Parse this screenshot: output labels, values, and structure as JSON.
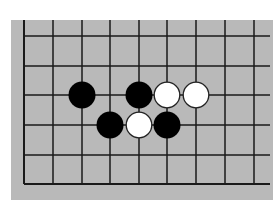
{
  "diagram": {
    "type": "go-board-fragment",
    "board_color": "#b9b9b9",
    "line_color": "#1a1a1a",
    "grid": {
      "x_lines": [
        24,
        53,
        82,
        110,
        139,
        167,
        196,
        225,
        254
      ],
      "y_lines": [
        36,
        66,
        95,
        125,
        155,
        184
      ],
      "left_edge_closed": true,
      "bottom_edge_closed": true,
      "top_edge_closed": false,
      "right_edge_closed": false
    },
    "stones": [
      {
        "color": "black",
        "col": 2,
        "row": 2
      },
      {
        "color": "black",
        "col": 4,
        "row": 2
      },
      {
        "color": "white",
        "col": 5,
        "row": 2
      },
      {
        "color": "white",
        "col": 6,
        "row": 2
      },
      {
        "color": "black",
        "col": 3,
        "row": 3
      },
      {
        "color": "white",
        "col": 4,
        "row": 3
      },
      {
        "color": "black",
        "col": 5,
        "row": 3
      }
    ],
    "marks": [
      {
        "type": "small-dot",
        "col": 3,
        "row": 2
      }
    ]
  }
}
